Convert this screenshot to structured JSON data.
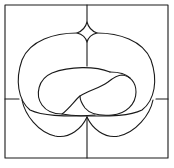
{
  "diagram": {
    "title": "",
    "colors": {
      "background": "#ffffff",
      "stroke": "#1a1a1a"
    },
    "stroke_width": 1.1,
    "elements": [
      {
        "name": "outer-frame",
        "type": "rect"
      },
      {
        "name": "center-vertical-line",
        "type": "line"
      },
      {
        "name": "left-horizontal-line",
        "type": "line"
      },
      {
        "name": "right-horizontal-line",
        "type": "line"
      },
      {
        "name": "top-diamond",
        "type": "curve"
      },
      {
        "name": "outer-lobe",
        "type": "curve"
      },
      {
        "name": "lower-left-lobe",
        "type": "curve"
      },
      {
        "name": "lower-right-lobe",
        "type": "curve"
      },
      {
        "name": "inner-loop-left",
        "type": "curve"
      },
      {
        "name": "inner-loop-right",
        "type": "curve"
      }
    ]
  }
}
